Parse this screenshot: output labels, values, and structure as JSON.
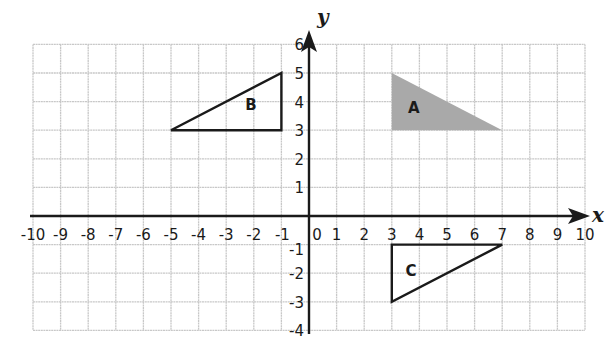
{
  "chart_data": {
    "type": "coordinate-plane",
    "title": "",
    "xlabel": "x",
    "ylabel": "y",
    "xlim": [
      -10,
      10
    ],
    "ylim": [
      -4,
      6
    ],
    "grid": true,
    "x_ticks": [
      "-10",
      "-9",
      "-8",
      "-7",
      "-6",
      "-5",
      "-4",
      "-3",
      "-2",
      "-1",
      "0",
      "1",
      "2",
      "3",
      "4",
      "5",
      "6",
      "7",
      "8",
      "9",
      "10"
    ],
    "y_ticks": [
      "6",
      "5",
      "4",
      "3",
      "2",
      "1",
      "-1",
      "-2",
      "-3",
      "-4"
    ],
    "shapes": [
      {
        "label": "A",
        "type": "triangle",
        "vertices": [
          [
            3,
            5
          ],
          [
            3,
            3
          ],
          [
            7,
            3
          ]
        ],
        "style": "filled",
        "fill": "#a9a9a9",
        "label_pos": [
          3.8,
          3.8
        ]
      },
      {
        "label": "B",
        "type": "triangle",
        "vertices": [
          [
            -1,
            5
          ],
          [
            -1,
            3
          ],
          [
            -5,
            3
          ]
        ],
        "style": "outline",
        "label_pos": [
          -2.1,
          3.9
        ]
      },
      {
        "label": "C",
        "type": "triangle",
        "vertices": [
          [
            3,
            -1
          ],
          [
            7,
            -1
          ],
          [
            3,
            -3
          ]
        ],
        "style": "outline",
        "label_pos": [
          3.7,
          -1.9
        ]
      }
    ]
  },
  "colors": {
    "grid": "#c8c8c8",
    "axis": "#1a1a1a",
    "fill_A": "#a9a9a9"
  }
}
